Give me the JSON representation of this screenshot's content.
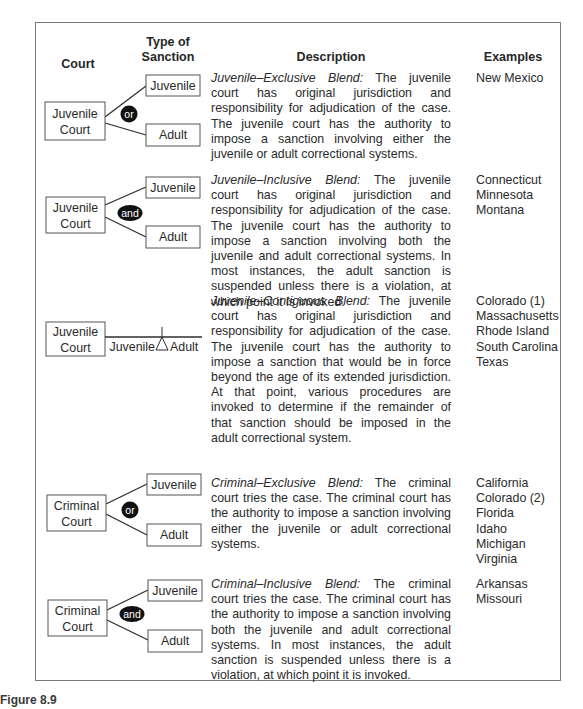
{
  "headers": {
    "court": "Court",
    "type_of_sanction_line1": "Type of",
    "type_of_sanction_line2": "Sanction",
    "description": "Description",
    "examples": "Examples"
  },
  "rows": [
    {
      "court_line1": "Juvenile",
      "court_line2": "Court",
      "connector": "or",
      "sanction_top": "Juvenile",
      "sanction_bottom": "Adult",
      "blend_name": "Juvenile–Exclusive Blend:",
      "description": "The juvenile court has original jurisdiction and responsibility for adjudication of the case. The juvenile court has the authority to impose a sanction involving either the juvenile or adult correctional systems.",
      "examples": [
        "New Mexico"
      ]
    },
    {
      "court_line1": "Juvenile",
      "court_line2": "Court",
      "connector": "and",
      "sanction_top": "Juvenile",
      "sanction_bottom": "Adult",
      "blend_name": "Juvenile–Inclusive Blend:",
      "description": "The juvenile court has original jurisdiction and responsibility for adjudication of the case. The juvenile court has the authority to impose a sanction involving both the juvenile and adult correctional systems. In most instances, the adult sanction is suspended unless there is a violation, at which point it is invoked.",
      "examples": [
        "Connecticut",
        "Minnesota",
        "Montana"
      ]
    },
    {
      "court_line1": "Juvenile",
      "court_line2": "Court",
      "sanction_left": "Juvenile",
      "sanction_right": "Adult",
      "blend_name": "Juvenile–Contiguous Blend:",
      "description": "The juvenile court has original jurisdiction and responsibility for adjudication of the case. The juvenile court has the authority to impose a sanction that would be in force beyond the age of its extended jurisdiction. At that point, various procedures are invoked to determine if the remainder of that sanction should be imposed in the adult correctional system.",
      "examples": [
        "Colorado (1)",
        "Massachusetts",
        "Rhode Island",
        "South Carolina",
        "Texas"
      ]
    },
    {
      "court_line1": "Criminal",
      "court_line2": "Court",
      "connector": "or",
      "sanction_top": "Juvenile",
      "sanction_bottom": "Adult",
      "blend_name": "Criminal–Exclusive Blend:",
      "description": "The criminal court tries the case. The criminal court has the authority to impose a sanction involving either the juvenile or adult correctional systems.",
      "examples": [
        "California",
        "Colorado (2)",
        "Florida",
        "Idaho",
        "Michigan",
        "Virginia"
      ]
    },
    {
      "court_line1": "Criminal",
      "court_line2": "Court",
      "connector": "and",
      "sanction_top": "Juvenile",
      "sanction_bottom": "Adult",
      "blend_name": "Criminal–Inclusive Blend:",
      "description": "The criminal court tries the case. The criminal court has the authority to impose a sanction involving both the juvenile and adult correctional systems. In most instances, the adult sanction is suspended unless there is a violation, at which point it is invoked.",
      "examples": [
        "Arkansas",
        "Missouri"
      ]
    }
  ],
  "caption": "Figure 8.9",
  "colors": {
    "line": "#2e2e2e",
    "frame": "#7a7a7a",
    "connector_fill": "#111111",
    "connector_text": "#ffffff"
  }
}
